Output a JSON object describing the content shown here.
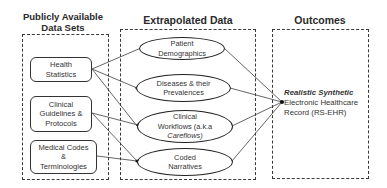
{
  "headers": {
    "left": "Publicly Available Data Sets",
    "middle": "Extrapolated Data",
    "right": "Outcomes"
  },
  "data_sets": [
    {
      "id": "health-statistics",
      "label": "Health Statistics",
      "line1": "Health",
      "line2": "Statistics"
    },
    {
      "id": "clinical-guidelines",
      "label": "Clinical Guidelines & Protocols",
      "line1": "Clinical",
      "line2": "Guidelines &",
      "line3": "Protocols"
    },
    {
      "id": "medical-codes",
      "label": "Medical Codes & Terminologies",
      "line1": "Medical Codes",
      "line2": "&",
      "line3": "Terminologies"
    }
  ],
  "extrapolated": [
    {
      "id": "patient-demographics",
      "line1": "Patient",
      "line2": "Demographics"
    },
    {
      "id": "diseases",
      "line1": "Diseases & their",
      "line2": "Prevalences"
    },
    {
      "id": "clinical-workflows",
      "line1": "Clinical",
      "line2": "Workflows (a.k.a",
      "line3": "Careflows)"
    },
    {
      "id": "coded-narratives",
      "line1": "Coded",
      "line2": "Narratives"
    }
  ],
  "outcome": {
    "line1": "Realistic Synthetic",
    "line2": "Electronic Healthcare",
    "line3": "Record (RS-EHR)"
  },
  "connections": [
    {
      "from": "health-statistics",
      "to": "patient-demographics"
    },
    {
      "from": "health-statistics",
      "to": "diseases"
    },
    {
      "from": "health-statistics",
      "to": "clinical-workflows"
    },
    {
      "from": "clinical-guidelines",
      "to": "clinical-workflows"
    },
    {
      "from": "clinical-guidelines",
      "to": "coded-narratives"
    },
    {
      "from": "medical-codes",
      "to": "coded-narratives"
    },
    {
      "from": "patient-demographics",
      "to": "outcome"
    },
    {
      "from": "diseases",
      "to": "outcome"
    },
    {
      "from": "clinical-workflows",
      "to": "outcome"
    },
    {
      "from": "coded-narratives",
      "to": "outcome"
    }
  ],
  "colors": {
    "stroke": "#333333",
    "background": "#ffffff"
  }
}
